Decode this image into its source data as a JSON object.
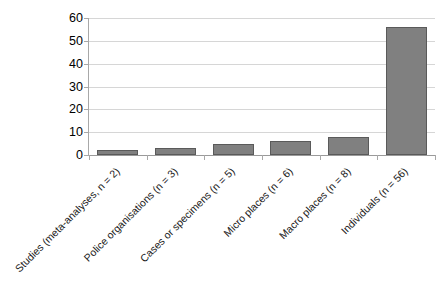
{
  "chart_data": {
    "type": "bar",
    "title": "",
    "subtitle": "",
    "xlabel": "",
    "ylabel": "",
    "categories": [
      "Studies (meta-analyses, n = 2)",
      "Police organisations (n = 3)",
      "Cases or specimens (n = 5)",
      "Micro places (n = 6)",
      "Macro places (n = 8)",
      "Individuals (n = 56)"
    ],
    "values": [
      2,
      3,
      5,
      6,
      8,
      56
    ],
    "ylim": [
      0,
      60
    ],
    "yticks": [
      0,
      10,
      20,
      30,
      40,
      50,
      60
    ],
    "ytick_labels": [
      "0",
      "10",
      "20",
      "30",
      "40",
      "50",
      "60"
    ],
    "grid": true,
    "grid_axis": "y",
    "legend": false,
    "legend_position": "none",
    "bar_color": "#808080",
    "bar_border_color": "#5a5a5a",
    "gridline_color": "#d6d6d6",
    "axis_color": "#a8a8a8",
    "background": "#ffffff",
    "xtick_label_rotation": -45
  }
}
